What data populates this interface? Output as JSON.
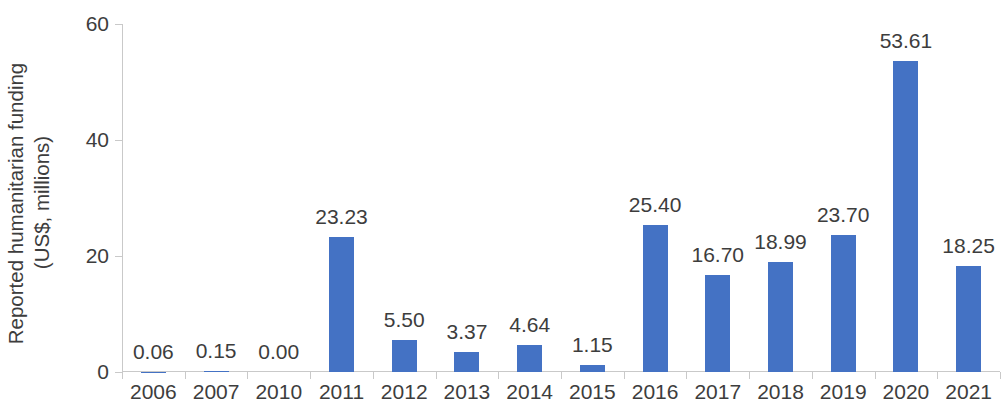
{
  "chart_data": {
    "type": "bar",
    "title": "",
    "xlabel": "",
    "ylabel": "Reported humanitarian funding (US$, millions)",
    "ylabel_lines": [
      "Reported humanitarian funding",
      "(US$, millions)"
    ],
    "categories": [
      "2006",
      "2007",
      "2010",
      "2011",
      "2012",
      "2013",
      "2014",
      "2015",
      "2016",
      "2017",
      "2018",
      "2019",
      "2020",
      "2021"
    ],
    "values": [
      0.06,
      0.15,
      0.0,
      23.23,
      5.5,
      3.37,
      4.64,
      1.15,
      25.4,
      16.7,
      18.99,
      23.7,
      53.61,
      18.25
    ],
    "value_labels": [
      "0.06",
      "0.15",
      "0.00",
      "23.23",
      "5.50",
      "3.37",
      "4.64",
      "1.15",
      "25.40",
      "16.70",
      "18.99",
      "23.70",
      "53.61",
      "18.25"
    ],
    "ylim": [
      0,
      60
    ],
    "yticks": [
      0,
      20,
      40,
      60
    ],
    "ytick_labels": [
      "0",
      "20",
      "40",
      "60"
    ],
    "grid": false,
    "legend": null,
    "series_color": "#4472c4",
    "axis_color": "#c9c9c9",
    "text_color": "#3d3d3d",
    "data_labels_shown": true
  }
}
